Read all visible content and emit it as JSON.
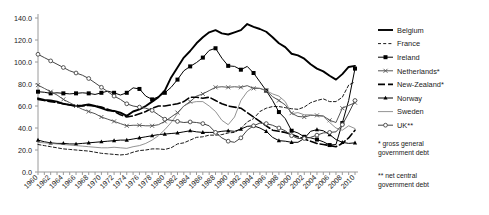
{
  "chart_data": {
    "type": "line",
    "title": "",
    "xlabel": "",
    "ylabel": "",
    "xlim": [
      1960,
      2010
    ],
    "ylim": [
      0.0,
      140.0
    ],
    "grid": false,
    "legend_position": "right",
    "ytick_labels": [
      "0.0",
      "20.0",
      "40.0",
      "60.0",
      "80.0",
      "100.0",
      "120.0",
      "140.0"
    ],
    "ytick_values": [
      0,
      20,
      40,
      60,
      80,
      100,
      120,
      140
    ],
    "xtick_labels": [
      "1960",
      "1962",
      "1964",
      "1966",
      "1968",
      "1970",
      "1972",
      "1974",
      "1976",
      "1978",
      "1980",
      "1982",
      "1984",
      "1986",
      "1988",
      "1990",
      "1992",
      "1994",
      "1996",
      "1998",
      "2000",
      "2002",
      "2004",
      "2006",
      "2008",
      "2010"
    ],
    "xtick_values": [
      1960,
      1962,
      1964,
      1966,
      1968,
      1970,
      1972,
      1974,
      1976,
      1978,
      1980,
      1982,
      1984,
      1986,
      1988,
      1990,
      1992,
      1994,
      1996,
      1998,
      2000,
      2002,
      2004,
      2006,
      2008,
      2010
    ],
    "x": [
      1960,
      1961,
      1962,
      1963,
      1964,
      1965,
      1966,
      1967,
      1968,
      1969,
      1970,
      1971,
      1972,
      1973,
      1974,
      1975,
      1976,
      1977,
      1978,
      1979,
      1980,
      1981,
      1982,
      1983,
      1984,
      1985,
      1986,
      1987,
      1988,
      1989,
      1990,
      1991,
      1992,
      1993,
      1994,
      1995,
      1996,
      1997,
      1998,
      1999,
      2000,
      2001,
      2002,
      2003,
      2004,
      2005,
      2006,
      2007,
      2008,
      2009,
      2010
    ],
    "series": [
      {
        "name": "Belgium",
        "style": "solid-thick",
        "marker": "none",
        "color": "#000000",
        "values": [
          67.0,
          65.5,
          65.0,
          64.0,
          62.0,
          61.0,
          60.0,
          60.5,
          61.5,
          60.0,
          58.0,
          56.0,
          55.5,
          54.0,
          51.0,
          55.0,
          57.0,
          60.0,
          64.0,
          68.0,
          74.0,
          86.0,
          95.0,
          104.0,
          110.0,
          117.0,
          122.5,
          127.0,
          129.0,
          126.0,
          125.0,
          127.0,
          129.0,
          134.5,
          132.0,
          130.0,
          127.5,
          122.5,
          117.0,
          113.5,
          107.5,
          106.0,
          103.0,
          98.0,
          94.0,
          91.5,
          87.5,
          84.0,
          89.0,
          95.5,
          96.5
        ]
      },
      {
        "name": "France",
        "style": "dashed",
        "marker": "none",
        "color": "#1a1a1a",
        "values": [
          25.0,
          24.0,
          23.0,
          22.0,
          21.0,
          20.5,
          20.0,
          19.5,
          19.0,
          18.0,
          17.0,
          16.5,
          16.0,
          15.5,
          16.0,
          18.0,
          19.5,
          20.0,
          21.0,
          21.0,
          20.5,
          22.0,
          25.5,
          26.5,
          29.0,
          31.5,
          32.0,
          33.5,
          33.5,
          34.0,
          35.5,
          36.0,
          39.5,
          45.5,
          48.5,
          55.0,
          58.0,
          59.5,
          59.5,
          58.5,
          57.5,
          57.0,
          59.0,
          63.0,
          65.0,
          66.5,
          64.0,
          64.0,
          68.0,
          79.0,
          82.0
        ]
      },
      {
        "name": "Ireland",
        "style": "solid",
        "marker": "square-filled",
        "color": "#000000",
        "values": [
          73.0,
          72.5,
          71.5,
          72.0,
          71.5,
          71.0,
          71.5,
          72.0,
          71.5,
          70.5,
          72.0,
          73.5,
          72.0,
          70.0,
          72.0,
          76.5,
          75.5,
          69.0,
          66.0,
          68.5,
          72.0,
          77.0,
          84.0,
          92.0,
          96.0,
          99.5,
          104.0,
          110.5,
          112.5,
          103.5,
          96.5,
          96.0,
          93.0,
          96.0,
          90.0,
          82.0,
          74.0,
          65.0,
          54.5,
          48.5,
          37.5,
          35.5,
          32.0,
          31.0,
          29.5,
          27.5,
          24.5,
          25.0,
          44.5,
          65.0,
          94.0
        ]
      },
      {
        "name": "Netherlands*",
        "style": "solid",
        "marker": "cross",
        "color": "#555555",
        "values": [
          79.0,
          76.0,
          73.0,
          70.0,
          66.0,
          63.0,
          60.0,
          57.0,
          55.0,
          53.0,
          50.0,
          48.0,
          46.0,
          44.0,
          42.0,
          42.5,
          42.5,
          42.0,
          42.0,
          43.0,
          46.0,
          50.0,
          54.0,
          60.0,
          64.0,
          69.0,
          71.0,
          74.0,
          77.0,
          77.5,
          77.0,
          77.5,
          77.0,
          78.5,
          76.0,
          76.0,
          74.0,
          68.5,
          65.0,
          61.0,
          53.5,
          50.5,
          50.0,
          51.5,
          51.5,
          51.0,
          47.0,
          45.0,
          58.0,
          60.5,
          63.0
        ]
      },
      {
        "name": "New-Zealand*",
        "style": "long-dash",
        "marker": "none",
        "color": "#000000",
        "values": [
          66.0,
          65.0,
          64.0,
          63.0,
          62.0,
          61.0,
          60.0,
          60.0,
          60.5,
          60.0,
          59.0,
          57.0,
          55.0,
          52.0,
          50.0,
          51.0,
          53.0,
          55.0,
          58.0,
          60.0,
          60.0,
          61.0,
          62.0,
          64.0,
          68.0,
          68.0,
          67.0,
          68.0,
          65.0,
          62.0,
          60.0,
          59.0,
          58.0,
          54.0,
          50.0,
          46.0,
          42.0,
          38.0,
          37.0,
          36.0,
          34.0,
          32.0,
          30.0,
          28.0,
          26.0,
          25.0,
          24.0,
          23.0,
          26.0,
          31.0,
          38.0
        ]
      },
      {
        "name": "Norway",
        "style": "solid",
        "marker": "triangle",
        "color": "#000000",
        "values": [
          29.0,
          27.5,
          26.5,
          26.0,
          26.0,
          25.5,
          25.5,
          26.0,
          26.5,
          27.0,
          27.5,
          28.0,
          28.5,
          29.0,
          29.0,
          30.0,
          31.0,
          32.0,
          33.0,
          34.0,
          34.5,
          35.0,
          35.5,
          36.5,
          37.5,
          36.5,
          36.0,
          36.0,
          36.0,
          37.0,
          37.5,
          37.0,
          39.0,
          41.5,
          42.0,
          40.0,
          37.0,
          31.5,
          28.5,
          28.0,
          27.0,
          27.0,
          30.5,
          37.0,
          38.5,
          37.5,
          34.0,
          29.5,
          27.0,
          26.0,
          26.5
        ]
      },
      {
        "name": "Sweden",
        "style": "solid-thin",
        "marker": "none",
        "color": "#777777",
        "values": [
          27.0,
          26.5,
          26.0,
          25.5,
          25.0,
          24.5,
          24.0,
          23.5,
          23.0,
          22.5,
          22.0,
          22.0,
          22.5,
          22.0,
          21.5,
          23.0,
          24.0,
          26.0,
          29.0,
          33.0,
          38.5,
          45.0,
          53.0,
          60.0,
          63.0,
          64.0,
          64.0,
          60.0,
          55.0,
          47.0,
          43.0,
          50.0,
          65.0,
          73.0,
          77.0,
          76.0,
          74.0,
          71.0,
          69.0,
          64.0,
          53.0,
          54.0,
          52.0,
          52.0,
          51.0,
          50.5,
          45.0,
          40.0,
          38.0,
          42.0,
          39.5
        ]
      },
      {
        "name": "UK**",
        "style": "solid",
        "marker": "circle-open",
        "color": "#444444",
        "values": [
          107.0,
          104.0,
          101.0,
          98.0,
          95.0,
          92.0,
          90.0,
          88.0,
          85.0,
          81.0,
          77.0,
          73.0,
          69.0,
          66.0,
          62.0,
          60.0,
          59.0,
          58.0,
          56.0,
          52.0,
          48.0,
          47.0,
          46.0,
          45.0,
          45.5,
          45.0,
          44.0,
          42.0,
          36.0,
          31.0,
          28.0,
          27.0,
          31.0,
          38.0,
          42.0,
          44.5,
          44.0,
          42.5,
          40.0,
          37.5,
          33.0,
          30.5,
          30.5,
          31.5,
          33.5,
          35.5,
          36.0,
          36.5,
          43.0,
          53.5,
          65.0
        ]
      }
    ]
  },
  "notes": {
    "note1": "* gross general government debt",
    "note2": "** net central government debt"
  }
}
